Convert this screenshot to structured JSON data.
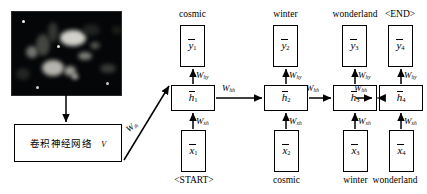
{
  "diagram": {
    "input_image": {
      "name": "nebula-photo",
      "alt": "dark astronomical nebula photograph"
    },
    "cnn_box": {
      "label": "卷积神经网络",
      "vector_label": "v"
    },
    "weights": {
      "input_to_hidden": "W",
      "input_to_hidden_sub": "ih",
      "x_to_hidden": "W",
      "x_to_hidden_sub": "xh",
      "hidden_to_hidden": "W",
      "hidden_to_hidden_sub": "hh",
      "hidden_to_output": "W",
      "hidden_to_output_sub": "hy"
    },
    "timesteps": [
      {
        "index": "1",
        "output_word": "cosmic",
        "input_word": "<START>",
        "y_symbol": "y",
        "h_symbol": "h",
        "x_symbol": "x"
      },
      {
        "index": "2",
        "output_word": "winter",
        "input_word": "cosmic",
        "y_symbol": "y",
        "h_symbol": "h",
        "x_symbol": "x"
      },
      {
        "index": "3",
        "output_word": "wonderland",
        "input_word": "winter",
        "y_symbol": "y",
        "h_symbol": "h",
        "x_symbol": "x"
      },
      {
        "index": "4",
        "output_word": "<END>",
        "input_word": "wonderland",
        "y_symbol": "y",
        "h_symbol": "h",
        "x_symbol": "x"
      }
    ],
    "colors": {
      "stroke": "#000000",
      "background": "#ffffff",
      "image_dark": "#050608"
    }
  }
}
